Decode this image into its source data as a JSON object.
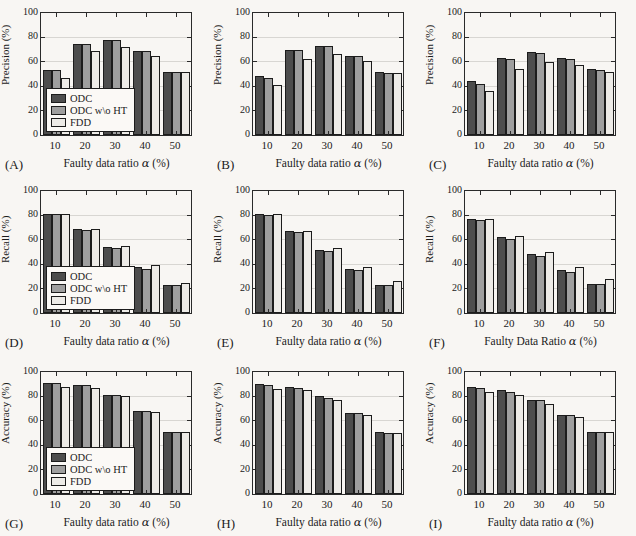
{
  "figure_title": "",
  "style": {
    "background": "#f8f6f3",
    "bar_colors": [
      "#4d4d4d",
      "#9f9f9f",
      "#edebe7"
    ],
    "bar_border": "#1c1c1c",
    "grid_color": "#d8d6d2",
    "axis_color": "#2a2a2a"
  },
  "chart_data": [
    {
      "type": "bar",
      "panel_label": "(A)",
      "ylabel": "Precision (%)",
      "xlabel_prefix": "Faulty data ratio ",
      "xlabel_alpha": "α",
      "xlabel_suffix": " (%)",
      "categories": [
        "10",
        "20",
        "30",
        "40",
        "50"
      ],
      "ylim": [
        0,
        100
      ],
      "yticks": [
        0,
        20,
        40,
        60,
        80,
        100
      ],
      "legend": true,
      "legend_position": "lower-left",
      "series": [
        {
          "name": "ODC",
          "values": [
            53,
            75,
            78,
            69,
            52
          ]
        },
        {
          "name": "ODC w\\o HT",
          "values": [
            53,
            75,
            78,
            69,
            52
          ]
        },
        {
          "name": "FDD",
          "values": [
            47,
            69,
            72,
            65,
            52
          ]
        }
      ]
    },
    {
      "type": "bar",
      "panel_label": "(B)",
      "ylabel": "Precision (%)",
      "xlabel_prefix": "Faulty data ratio ",
      "xlabel_alpha": "α",
      "xlabel_suffix": " (%)",
      "categories": [
        "10",
        "20",
        "30",
        "40",
        "50"
      ],
      "ylim": [
        0,
        100
      ],
      "yticks": [
        0,
        20,
        40,
        60,
        80,
        100
      ],
      "legend": false,
      "series": [
        {
          "name": "ODC",
          "values": [
            48,
            70,
            73,
            65,
            52
          ]
        },
        {
          "name": "ODC w\\o HT",
          "values": [
            47,
            70,
            73,
            65,
            51
          ]
        },
        {
          "name": "FDD",
          "values": [
            41,
            62,
            66,
            61,
            51
          ]
        }
      ]
    },
    {
      "type": "bar",
      "panel_label": "(C)",
      "ylabel": "Precision (%)",
      "xlabel_prefix": "Faulty data ratio ",
      "xlabel_alpha": "α",
      "xlabel_suffix": " (%)",
      "categories": [
        "10",
        "20",
        "30",
        "40",
        "50"
      ],
      "ylim": [
        0,
        100
      ],
      "yticks": [
        0,
        20,
        40,
        60,
        80,
        100
      ],
      "legend": false,
      "series": [
        {
          "name": "ODC",
          "values": [
            44,
            63,
            68,
            63,
            54
          ]
        },
        {
          "name": "ODC w\\o HT",
          "values": [
            42,
            62,
            67,
            62,
            53
          ]
        },
        {
          "name": "FDD",
          "values": [
            36,
            54,
            60,
            57,
            52
          ]
        }
      ]
    },
    {
      "type": "bar",
      "panel_label": "(D)",
      "ylabel": "Recall (%)",
      "xlabel_prefix": "Faulty data ratio ",
      "xlabel_alpha": "α",
      "xlabel_suffix": " (%)",
      "categories": [
        "10",
        "20",
        "30",
        "40",
        "50"
      ],
      "ylim": [
        0,
        100
      ],
      "yticks": [
        0,
        20,
        40,
        60,
        80,
        100
      ],
      "legend": true,
      "legend_position": "lower-left",
      "series": [
        {
          "name": "ODC",
          "values": [
            81,
            69,
            54,
            38,
            23
          ]
        },
        {
          "name": "ODC w\\o HT",
          "values": [
            81,
            68,
            53,
            36,
            23
          ]
        },
        {
          "name": "FDD",
          "values": [
            81,
            69,
            55,
            39,
            25
          ]
        }
      ]
    },
    {
      "type": "bar",
      "panel_label": "(E)",
      "ylabel": "Recall (%)",
      "xlabel_prefix": "Faulty data ratio ",
      "xlabel_alpha": "α",
      "xlabel_suffix": " (%)",
      "categories": [
        "10",
        "20",
        "30",
        "40",
        "50"
      ],
      "ylim": [
        0,
        100
      ],
      "yticks": [
        0,
        20,
        40,
        60,
        80,
        100
      ],
      "legend": false,
      "series": [
        {
          "name": "ODC",
          "values": [
            81,
            67,
            52,
            36,
            23
          ]
        },
        {
          "name": "ODC w\\o HT",
          "values": [
            80,
            66,
            51,
            35,
            23
          ]
        },
        {
          "name": "FDD",
          "values": [
            81,
            67,
            53,
            38,
            26
          ]
        }
      ]
    },
    {
      "type": "bar",
      "panel_label": "(F)",
      "ylabel": "Recall (%)",
      "xlabel_prefix": "Faulty Data Ratio ",
      "xlabel_alpha": "α",
      "xlabel_suffix": " (%)",
      "categories": [
        "10",
        "20",
        "30",
        "40",
        "50"
      ],
      "ylim": [
        0,
        100
      ],
      "yticks": [
        0,
        20,
        40,
        60,
        80,
        100
      ],
      "legend": false,
      "series": [
        {
          "name": "ODC",
          "values": [
            77,
            62,
            48,
            35,
            24
          ]
        },
        {
          "name": "ODC w\\o HT",
          "values": [
            76,
            61,
            47,
            34,
            24
          ]
        },
        {
          "name": "FDD",
          "values": [
            77,
            63,
            50,
            38,
            28
          ]
        }
      ]
    },
    {
      "type": "bar",
      "panel_label": "(G)",
      "ylabel": "Accuracy (%)",
      "xlabel_prefix": "Faulty data ratio ",
      "xlabel_alpha": "α",
      "xlabel_suffix": " (%)",
      "categories": [
        "10",
        "20",
        "30",
        "40",
        "50"
      ],
      "ylim": [
        0,
        100
      ],
      "yticks": [
        0,
        20,
        40,
        60,
        80,
        100
      ],
      "legend": true,
      "legend_position": "lower-left",
      "series": [
        {
          "name": "ODC",
          "values": [
            91,
            89,
            81,
            68,
            51
          ]
        },
        {
          "name": "ODC w\\o HT",
          "values": [
            91,
            89,
            81,
            68,
            51
          ]
        },
        {
          "name": "FDD",
          "values": [
            88,
            87,
            80,
            67,
            51
          ]
        }
      ]
    },
    {
      "type": "bar",
      "panel_label": "(H)",
      "ylabel": "Accuracy (%)",
      "xlabel_prefix": "Faulty data ratio ",
      "xlabel_alpha": "α",
      "xlabel_suffix": " (%)",
      "categories": [
        "10",
        "20",
        "30",
        "40",
        "50"
      ],
      "ylim": [
        0,
        100
      ],
      "yticks": [
        0,
        20,
        40,
        60,
        80,
        100
      ],
      "legend": false,
      "series": [
        {
          "name": "ODC",
          "values": [
            90,
            88,
            80,
            66,
            51
          ]
        },
        {
          "name": "ODC w\\o HT",
          "values": [
            89,
            87,
            79,
            66,
            50
          ]
        },
        {
          "name": "FDD",
          "values": [
            86,
            85,
            77,
            65,
            50
          ]
        }
      ]
    },
    {
      "type": "bar",
      "panel_label": "(I)",
      "ylabel": "Accuracy (%)",
      "xlabel_prefix": "Faulty data ratio ",
      "xlabel_alpha": "α",
      "xlabel_suffix": " (%)",
      "categories": [
        "10",
        "20",
        "30",
        "40",
        "50"
      ],
      "ylim": [
        0,
        100
      ],
      "yticks": [
        0,
        20,
        40,
        60,
        80,
        100
      ],
      "legend": false,
      "series": [
        {
          "name": "ODC",
          "values": [
            88,
            85,
            77,
            65,
            51
          ]
        },
        {
          "name": "ODC w\\o HT",
          "values": [
            87,
            84,
            77,
            65,
            51
          ]
        },
        {
          "name": "FDD",
          "values": [
            84,
            81,
            74,
            63,
            51
          ]
        }
      ]
    }
  ]
}
